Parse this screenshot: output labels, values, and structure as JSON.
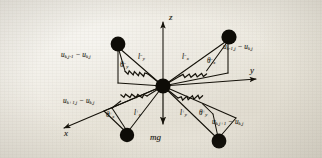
{
  "figure": {
    "background_color": "#ebe7dd",
    "ink_color": "#141109"
  },
  "axes": {
    "z": "z",
    "y": "y",
    "x": "x"
  },
  "gravity": {
    "label": "mg"
  },
  "displacements": [
    {
      "name": "upper-left",
      "base": "u",
      "sub1": "k,j-1",
      "op": "−",
      "base2": "u",
      "sub2": "k,j"
    },
    {
      "name": "upper-right",
      "base": "u",
      "sub1": "k-1,j",
      "op": "−",
      "base2": "u",
      "sub2": "k,j"
    },
    {
      "name": "lower-left",
      "base": "u",
      "sub1": "k+1,j",
      "op": "−",
      "base2": "u",
      "sub2": "k,j"
    },
    {
      "name": "lower-right",
      "base": "u",
      "sub1": "k,j+1",
      "op": "−",
      "base2": "u",
      "sub2": "k,j"
    }
  ],
  "spring_lengths": [
    {
      "name": "upper-left",
      "base": "l",
      "sup": "−",
      "sub": "y"
    },
    {
      "name": "upper-right",
      "base": "l",
      "sup": "−",
      "sub": "x"
    },
    {
      "name": "lower-left",
      "base": "l",
      "sup": "+",
      "sub": "x"
    },
    {
      "name": "lower-right",
      "base": "l",
      "sup": "+",
      "sub": "y"
    }
  ],
  "angles": [
    {
      "name": "upper-left",
      "base": "θ",
      "sup": "−",
      "sub": "y"
    },
    {
      "name": "upper-right",
      "base": "θ",
      "sup": "−",
      "sub": "x"
    },
    {
      "name": "lower-left",
      "base": "θ",
      "sup": "+",
      "sub": "x"
    },
    {
      "name": "lower-right",
      "base": "θ",
      "sup": "+",
      "sub": "y"
    }
  ],
  "nodes": {
    "center": "central-mass",
    "outer": [
      "mass-upper-left",
      "mass-upper-right",
      "mass-lower-left",
      "mass-lower-right"
    ]
  }
}
